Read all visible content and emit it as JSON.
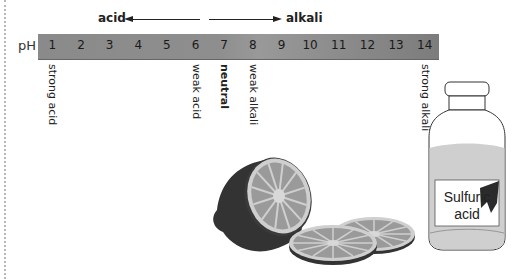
{
  "diagram": {
    "title_arrows": {
      "acid_label": "acid",
      "alkali_label": "alkali"
    },
    "scale": {
      "axis_label": "pH",
      "values": [
        "1",
        "2",
        "3",
        "4",
        "5",
        "6",
        "7",
        "8",
        "9",
        "10",
        "11",
        "12",
        "13",
        "14"
      ]
    },
    "annotations": [
      {
        "ph": 1,
        "text": "strong acid",
        "bold": false
      },
      {
        "ph": 6,
        "text": "weak acid",
        "bold": false
      },
      {
        "ph": 7,
        "text": "neutral",
        "bold": true
      },
      {
        "ph": 8,
        "text": "weak alkali",
        "bold": false
      },
      {
        "ph": 14,
        "text": "strong alkali",
        "bold": false
      }
    ],
    "illustrations": {
      "lemon": "lemon-halves-and-slices",
      "bottle_label_line1": "Sulfuric",
      "bottle_label_line2": "acid"
    },
    "colors": {
      "bar": "#8e8e8e",
      "text": "#222222",
      "lemon_rind": "#3a3a3a",
      "lemon_flesh": "#8a8a8a",
      "lemon_pith": "#cfcfcf"
    }
  }
}
